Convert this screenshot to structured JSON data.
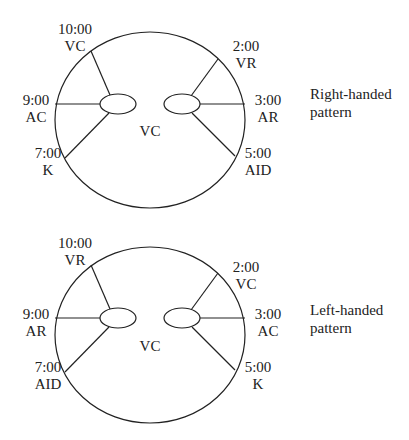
{
  "diagrams": [
    {
      "id": "right",
      "caption": "Right-handed\npattern",
      "caption_line1": "Right-handed",
      "caption_line2": "pattern",
      "center_label": "VC",
      "positions": [
        {
          "clock": "10:00",
          "code": "VC"
        },
        {
          "clock": "9:00",
          "code": "AC"
        },
        {
          "clock": "7:00",
          "code": "K"
        },
        {
          "clock": "2:00",
          "code": "VR"
        },
        {
          "clock": "3:00",
          "code": "AR"
        },
        {
          "clock": "5:00",
          "code": "AID"
        }
      ]
    },
    {
      "id": "left",
      "caption_line1": "Left-handed",
      "caption_line2": "pattern",
      "center_label": "VC",
      "positions": [
        {
          "clock": "10:00",
          "code": "VR"
        },
        {
          "clock": "9:00",
          "code": "AR"
        },
        {
          "clock": "7:00",
          "code": "AID"
        },
        {
          "clock": "2:00",
          "code": "VC"
        },
        {
          "clock": "3:00",
          "code": "AC"
        },
        {
          "clock": "5:00",
          "code": "K"
        }
      ]
    }
  ],
  "colors": {
    "stroke": "#222222",
    "background": "#ffffff"
  }
}
